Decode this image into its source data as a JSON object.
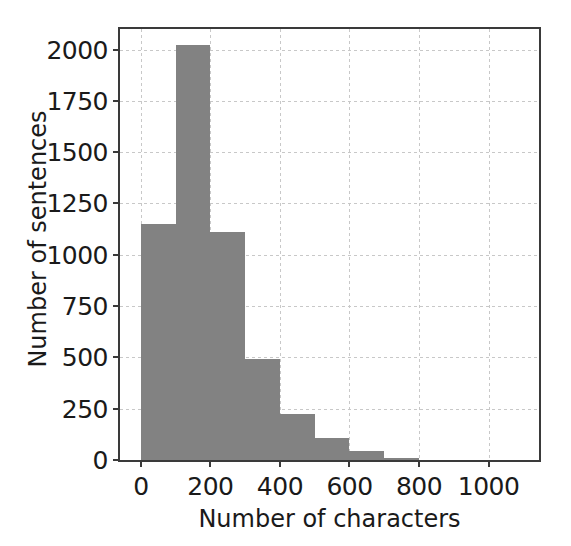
{
  "chart_data": {
    "type": "bar",
    "title": "",
    "xlabel": "Number of characters",
    "ylabel": "Number of sentences",
    "xlim": [
      -60,
      1145
    ],
    "ylim": [
      0,
      2100
    ],
    "grid": true,
    "legend": null,
    "bar_color": "#828282",
    "bin_width": 100,
    "categories": [
      "0-100",
      "100-200",
      "200-300",
      "300-400",
      "400-500",
      "500-600",
      "600-700",
      "700-800"
    ],
    "bin_edges": [
      0,
      100,
      200,
      300,
      400,
      500,
      600,
      700,
      800
    ],
    "x": [
      50,
      150,
      250,
      350,
      450,
      550,
      650,
      750
    ],
    "values": [
      1150,
      2020,
      1110,
      490,
      225,
      105,
      45,
      8
    ],
    "xticks": [
      0,
      200,
      400,
      600,
      800,
      1000
    ],
    "xtick_labels": [
      "0",
      "200",
      "400",
      "600",
      "800",
      "1000"
    ],
    "yticks": [
      0,
      250,
      500,
      750,
      1000,
      1250,
      1500,
      1750,
      2000
    ],
    "ytick_labels": [
      "0",
      "250",
      "500",
      "750",
      "1000",
      "1250",
      "1500",
      "1750",
      "2000"
    ]
  }
}
